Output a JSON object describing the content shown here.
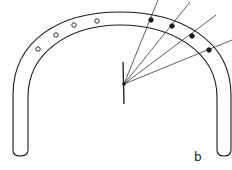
{
  "diagram": {
    "label": "b",
    "stroke_color": "#1a1a1a",
    "background": "#ffffff",
    "arch": {
      "outer_path": "M13,150 L13,95 C13,40 60,12 120,12 C180,12 231,40 231,95 L231,150",
      "inner_path": "M28,150 L28,97 C28,52 70,25 120,25 C172,25 217,52 217,97 L217,150",
      "left_foot": "M13,150 Q13,156 20,156 Q28,156 28,150",
      "right_foot": "M217,150 Q217,156 224,156 Q231,156 231,150"
    },
    "open_circles": [
      {
        "cx": 38,
        "cy": 49
      },
      {
        "cx": 56,
        "cy": 35
      },
      {
        "cx": 74,
        "cy": 25
      },
      {
        "cx": 97,
        "cy": 21
      }
    ],
    "filled_dots": [
      {
        "cx": 151,
        "cy": 20
      },
      {
        "cx": 172,
        "cy": 26
      },
      {
        "cx": 192,
        "cy": 36
      },
      {
        "cx": 209,
        "cy": 50
      }
    ],
    "center": {
      "cx": 124,
      "cy": 84
    },
    "vertical_line": {
      "x1": 123,
      "y1": 62,
      "x2": 124,
      "y2": 104
    },
    "rays": [
      {
        "x2": 158,
        "y2": 0
      },
      {
        "x2": 190,
        "y2": 2
      },
      {
        "x2": 216,
        "y2": 15
      },
      {
        "x2": 232,
        "y2": 40
      }
    ]
  }
}
